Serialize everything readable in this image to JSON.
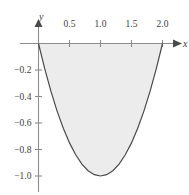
{
  "chart_data": {
    "type": "area",
    "title": "",
    "xlabel": "x",
    "ylabel": "y",
    "function": "y = x^2 - 2x",
    "xlim": [
      -0.1,
      2.2
    ],
    "ylim": [
      -1.08,
      0.12
    ],
    "grid": false,
    "legend": null,
    "shaded_region": {
      "from_x": 0.0,
      "to_x": 2.0,
      "between": "curve and x-axis",
      "fill_color": "#ececec"
    },
    "curve_color": "#4a4a4a",
    "axis_color": "#8c8c8c",
    "x_ticks": [
      {
        "value": 0.5,
        "label": "0.5"
      },
      {
        "value": 1.0,
        "label": "1.0"
      },
      {
        "value": 1.5,
        "label": "1.5"
      },
      {
        "value": 2.0,
        "label": "2.0"
      }
    ],
    "y_ticks": [
      {
        "value": -0.2,
        "label": "−0.2"
      },
      {
        "value": -0.4,
        "label": "−0.4"
      },
      {
        "value": -0.6,
        "label": "−0.6"
      },
      {
        "value": -0.8,
        "label": "−0.8"
      },
      {
        "value": -1.0,
        "label": "−1.0"
      }
    ],
    "points": [
      {
        "x": 0.0,
        "y": 0.0
      },
      {
        "x": 0.1,
        "y": -0.19
      },
      {
        "x": 0.2,
        "y": -0.36
      },
      {
        "x": 0.3,
        "y": -0.51
      },
      {
        "x": 0.4,
        "y": -0.64
      },
      {
        "x": 0.5,
        "y": -0.75
      },
      {
        "x": 0.6,
        "y": -0.84
      },
      {
        "x": 0.7,
        "y": -0.91
      },
      {
        "x": 0.8,
        "y": -0.96
      },
      {
        "x": 0.9,
        "y": -0.99
      },
      {
        "x": 1.0,
        "y": -1.0
      },
      {
        "x": 1.1,
        "y": -0.99
      },
      {
        "x": 1.2,
        "y": -0.96
      },
      {
        "x": 1.3,
        "y": -0.91
      },
      {
        "x": 1.4,
        "y": -0.84
      },
      {
        "x": 1.5,
        "y": -0.75
      },
      {
        "x": 1.6,
        "y": -0.64
      },
      {
        "x": 1.7,
        "y": -0.51
      },
      {
        "x": 1.8,
        "y": -0.36
      },
      {
        "x": 1.9,
        "y": -0.19
      },
      {
        "x": 2.0,
        "y": 0.0
      }
    ],
    "vertex": {
      "x": 1.0,
      "y": -1.0
    },
    "x_intercepts": [
      0.0,
      2.0
    ]
  },
  "axes": {
    "x_axis_label": "x",
    "y_axis_label": "y"
  }
}
